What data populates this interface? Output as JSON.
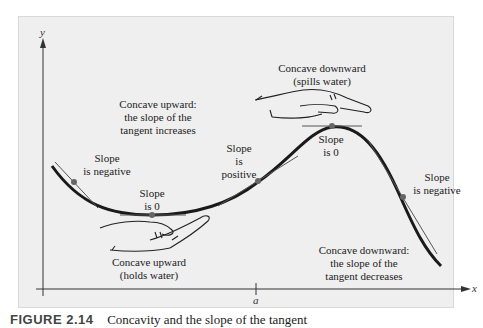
{
  "axes": {
    "x_label": "x",
    "y_label": "y",
    "x_tick_label": "a"
  },
  "labels": {
    "concave_up_title": [
      "Concave upward:",
      "the slope of the",
      "tangent increases"
    ],
    "concave_down_hand": [
      "Concave downward",
      "(spills water)"
    ],
    "concave_up_hand": [
      "Concave upward",
      "(holds water)"
    ],
    "concave_down_title": [
      "Concave downward:",
      "the slope of the",
      "tangent decreases"
    ],
    "slope_negative_left": [
      "Slope",
      "is negative"
    ],
    "slope_zero_min": [
      "Slope",
      "is 0"
    ],
    "slope_positive": [
      "Slope",
      "is",
      "positive"
    ],
    "slope_zero_max": [
      "Slope",
      "is 0"
    ],
    "slope_negative_right": [
      "Slope",
      "is negative"
    ]
  },
  "caption": {
    "figure_number": "FIGURE 2.14",
    "text": "Concavity and the slope of the tangent"
  },
  "colors": {
    "panel_bg": "#efefef",
    "curve": "#1a1a1a",
    "tangent": "#555555",
    "point": "#666666"
  }
}
